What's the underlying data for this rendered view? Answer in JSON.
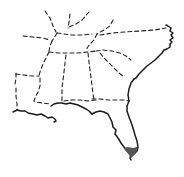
{
  "map": {
    "title": "",
    "region": "Southeastern United States",
    "legend": [],
    "colors": {
      "background": "#ffffff",
      "borders": "#222222",
      "coastline": "#1a1a1a",
      "highlight": "#555555"
    },
    "states": [
      {
        "name": "Kentucky"
      },
      {
        "name": "Virginia"
      },
      {
        "name": "Tennessee"
      },
      {
        "name": "North Carolina"
      },
      {
        "name": "Arkansas"
      },
      {
        "name": "Louisiana"
      },
      {
        "name": "Mississippi"
      },
      {
        "name": "Alabama"
      },
      {
        "name": "Georgia"
      },
      {
        "name": "South Carolina"
      },
      {
        "name": "Florida"
      }
    ],
    "highlighted_area": "Southern tip of Florida"
  }
}
